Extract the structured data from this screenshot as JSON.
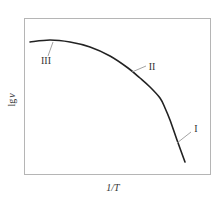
{
  "chart_data": {
    "type": "line",
    "title": "",
    "xlabel": "1/T",
    "ylabel": "lg v",
    "grid": false,
    "legend": null,
    "axis_ticks": "none",
    "series": [
      {
        "name": "lg v vs 1/T",
        "points_px": [
          [
            30,
            42
          ],
          [
            50,
            40
          ],
          [
            70,
            42
          ],
          [
            90,
            47
          ],
          [
            110,
            56
          ],
          [
            128,
            68
          ],
          [
            140,
            78
          ],
          [
            150,
            87
          ],
          [
            160,
            98
          ],
          [
            165,
            108
          ],
          [
            170,
            120
          ],
          [
            177,
            140
          ],
          [
            185,
            162
          ]
        ]
      }
    ],
    "annotations": [
      {
        "text": "III",
        "x": 46,
        "y": 64,
        "leader_from": [
          53,
          42
        ],
        "leader_to": [
          48,
          56
        ]
      },
      {
        "text": "II",
        "x": 152,
        "y": 70,
        "leader_from": [
          132,
          72
        ],
        "leader_to": [
          146,
          66
        ]
      },
      {
        "text": "I",
        "x": 196,
        "y": 132,
        "leader_from": [
          177,
          143
        ],
        "leader_to": [
          191,
          132
        ]
      }
    ]
  },
  "axes": {
    "xlabel": "1/T",
    "ylabel_main": "lg",
    "ylabel_var": "v"
  },
  "colors": {
    "curve": "#222222",
    "frame": "#b5b5b5",
    "leader": "#999999",
    "text": "#333333"
  }
}
